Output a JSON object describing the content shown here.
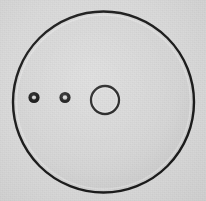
{
  "canvas": {
    "width": 206,
    "height": 201,
    "background_color": "#d9d9d9",
    "description": "Grayscale technical drawing of a circular disc plate with one central bore and two small holes"
  },
  "palette": {
    "background": "#d9d9d9",
    "disc_fill": "#d4d4d4",
    "outline": "#151515",
    "hole_ring": "#121212",
    "hole_center": "#cfcfcf",
    "highlight": "#f2f2f2"
  },
  "shapes": {
    "disc": {
      "label": "main-disc",
      "cx": 103.5,
      "cy": 102,
      "r": 90.5,
      "stroke_width": 2.4,
      "fill": "#d4d4d4",
      "stroke": "#151515"
    },
    "center_bore": {
      "label": "center-bore",
      "cx": 105,
      "cy": 100,
      "r": 14,
      "stroke_width": 2.3,
      "fill": "none",
      "stroke": "#151515"
    },
    "holes": [
      {
        "label": "hole-left",
        "cx": 34,
        "cy": 97.5,
        "r_outer": 5.6,
        "r_inner": 2.1,
        "ring_color": "#121212",
        "center_color": "#cfcfcf"
      },
      {
        "label": "hole-middle",
        "cx": 65,
        "cy": 97.5,
        "r_outer": 5.6,
        "r_inner": 2.3,
        "ring_color": "#121212",
        "center_color": "#cfcfcf"
      }
    ]
  },
  "chart_data": {
    "type": "scatter",
    "title": "",
    "xlabel": "",
    "ylabel": "",
    "xlim": [
      0,
      206
    ],
    "ylim": [
      0,
      201
    ],
    "grid": false,
    "legend": "none",
    "series": [
      {
        "name": "disc-outline",
        "x": [
          103.5
        ],
        "y": [
          102
        ],
        "radius": [
          90.5
        ],
        "style": "open-circle"
      },
      {
        "name": "center-bore",
        "x": [
          105
        ],
        "y": [
          100
        ],
        "radius": [
          14
        ],
        "style": "open-circle"
      },
      {
        "name": "small-holes",
        "x": [
          34,
          65
        ],
        "y": [
          97.5,
          97.5
        ],
        "radius": [
          5.6,
          5.6
        ],
        "style": "filled-ring"
      }
    ]
  }
}
